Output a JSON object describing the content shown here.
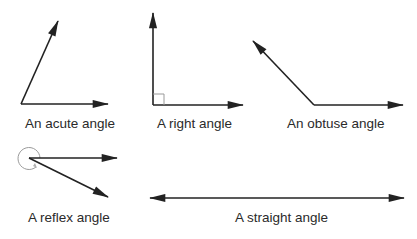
{
  "diagram": {
    "angles": [
      {
        "id": "acute",
        "label": "An acute angle",
        "degrees": 65
      },
      {
        "id": "right",
        "label": "A right angle",
        "degrees": 90
      },
      {
        "id": "obtuse",
        "label": "An obtuse angle",
        "degrees": 133
      },
      {
        "id": "reflex",
        "label": "A reflex angle",
        "degrees": 334
      },
      {
        "id": "straight",
        "label": "A straight angle",
        "degrees": 180
      }
    ],
    "colors": {
      "ray": "#222222",
      "marker": "#9a9a9a",
      "text": "#2a2a2a",
      "background": "#ffffff"
    }
  }
}
